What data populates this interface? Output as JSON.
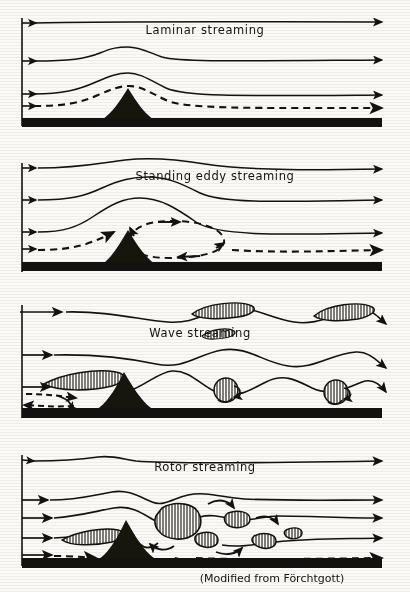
{
  "figure": {
    "caption": "(Modified from Förchtgott)",
    "background_color": "#fbfaf6",
    "ink_color": "#141210",
    "panel_count": 4
  },
  "panels": [
    {
      "id": "laminar",
      "title": "Laminar streaming",
      "title_x": 205,
      "title_y": 34,
      "inlet_arrow_count": 4,
      "streamlines": 3,
      "dashed_streamlines": 1,
      "clouds": [],
      "rotors": [],
      "description": "Smooth undisturbed flow; streamline deflection decreases with height."
    },
    {
      "id": "standing-eddy",
      "title": "Standing   eddy   streaming",
      "title_x": 215,
      "title_y": 180,
      "inlet_arrow_count": 4,
      "streamlines": 3,
      "dashed_streamlines": 1,
      "clouds": [],
      "rotors": [],
      "eddy": {
        "cx": 168,
        "cy": 240,
        "rx": 58,
        "ry": 19
      },
      "description": "A closed standing eddy forms in the lee of the ridge."
    },
    {
      "id": "wave",
      "title": "Wave        streaming",
      "title_x": 200,
      "title_y": 333,
      "inlet_arrow_count": 3,
      "streamlines": 3,
      "dashed_streamlines": 1,
      "clouds": [
        {
          "type": "lenticular",
          "cx": 218,
          "cy": 311
        },
        {
          "type": "lenticular",
          "cx": 340,
          "cy": 314
        },
        {
          "type": "lenticular",
          "cx": 218,
          "cy": 334
        },
        {
          "type": "cap",
          "cx": 82,
          "cy": 383
        }
      ],
      "rotors": [
        {
          "cx": 228,
          "cy": 390
        },
        {
          "cx": 338,
          "cy": 392
        }
      ],
      "description": "Lee waves with lenticular clouds aloft and rotor clouds beneath wave crests."
    },
    {
      "id": "rotor",
      "title": "Rotor streaming",
      "title_x": 205,
      "title_y": 471,
      "inlet_arrow_count": 4,
      "streamlines": 4,
      "dashed_streamlines": 1,
      "clouds": [
        {
          "type": "cap",
          "cx": 88,
          "cy": 537
        }
      ],
      "rotors": [
        {
          "cx": 180,
          "cy": 524,
          "r": 18
        },
        {
          "cx": 235,
          "cy": 520,
          "r": 9
        },
        {
          "cx": 205,
          "cy": 540,
          "r": 8
        },
        {
          "cx": 262,
          "cy": 541,
          "r": 8
        },
        {
          "cx": 292,
          "cy": 534,
          "r": 6
        }
      ],
      "description": "Violent rotor streaming with strong turbulent overturning downstream."
    }
  ],
  "legend": {
    "mountain_label": "mountain-ridge",
    "ground_label": "ground-surface",
    "solid_line_label": "streamline",
    "dashed_line_label": "lowest-streamline"
  }
}
